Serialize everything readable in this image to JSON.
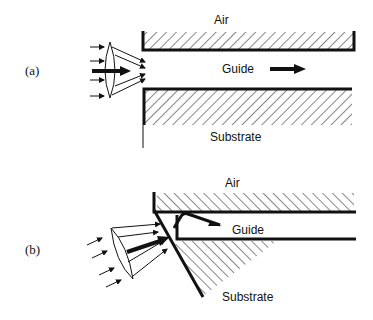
{
  "panel_a": {
    "label": "(a)",
    "air_label": "Air",
    "guide_label": "Guide",
    "substrate_label": "Substrate"
  },
  "panel_b": {
    "label": "(b)",
    "air_label": "Air",
    "guide_label": "Guide",
    "substrate_label": "Substrate"
  },
  "colors": {
    "ink": "#111111",
    "background": "#ffffff"
  }
}
